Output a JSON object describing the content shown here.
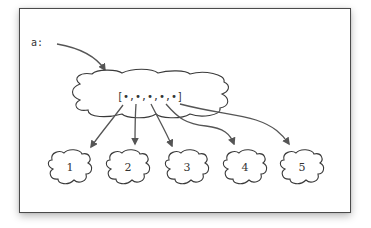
{
  "diagram": {
    "variable_label": "a:",
    "array_label": "[•,•,•,•,•]",
    "container_shape": "cloud",
    "elements": [
      {
        "label": "1"
      },
      {
        "label": "2"
      },
      {
        "label": "3"
      },
      {
        "label": "4"
      },
      {
        "label": "5"
      }
    ],
    "edges": [
      {
        "from": "a:",
        "to": "array"
      },
      {
        "from": "array.0",
        "to": "1"
      },
      {
        "from": "array.1",
        "to": "2"
      },
      {
        "from": "array.2",
        "to": "3"
      },
      {
        "from": "array.3",
        "to": "4"
      },
      {
        "from": "array.4",
        "to": "5"
      }
    ],
    "colors": {
      "stroke": "#3a3a3a",
      "arrow": "#555555",
      "frame_border": "#4a4a4a",
      "background": "#ffffff"
    }
  }
}
